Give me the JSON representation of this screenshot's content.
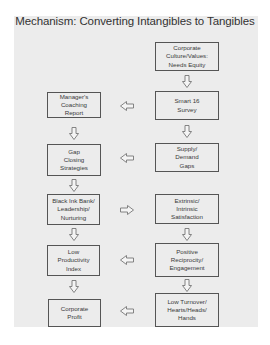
{
  "title": "Mechanism: Converting Intangibles to Tangibles",
  "colors": {
    "background": "#ececec",
    "box_border": "#555555",
    "text": "#3a3a3a",
    "arrow_stroke": "#777777"
  },
  "right_column": [
    {
      "id": "r1",
      "label": "Corporate\nCulture/Values:\nNeeds Equity"
    },
    {
      "id": "r2",
      "label": "Smart 16\nSurvey"
    },
    {
      "id": "r3",
      "label": "Supply/\nDemand\nGaps"
    },
    {
      "id": "r4",
      "label": "Extrinsic/\nIntrinsic\nSatisfaction"
    },
    {
      "id": "r5",
      "label": "Positive\nReciprocity/\nEngagement"
    },
    {
      "id": "r6",
      "label": "Low Turnover/\nHearts/Heads/\nHands"
    }
  ],
  "left_column": [
    {
      "id": "l1",
      "label": "Manager's\nCoaching\nReport"
    },
    {
      "id": "l2",
      "label": "Gap\nClosing\nStrategies"
    },
    {
      "id": "l3",
      "label": "Black Ink Bank/\nLeadership/\nNurturing"
    },
    {
      "id": "l4",
      "label": "Low\nProductivity\nIndex"
    },
    {
      "id": "l5",
      "label": "Corporate\nProfit"
    }
  ],
  "connections": [
    {
      "from": "r1",
      "to": "r2",
      "direction": "down"
    },
    {
      "from": "r2",
      "to": "r3",
      "direction": "down"
    },
    {
      "from": "r4",
      "to": "r5",
      "direction": "down"
    },
    {
      "from": "r5",
      "to": "r6",
      "direction": "down"
    },
    {
      "from": "r2",
      "to": "l1",
      "direction": "left"
    },
    {
      "from": "r3",
      "to": "l2",
      "direction": "left"
    },
    {
      "from": "l3",
      "to": "r4",
      "direction": "right"
    },
    {
      "from": "r5",
      "to": "l4",
      "direction": "left"
    },
    {
      "from": "r6",
      "to": "l5",
      "direction": "left"
    },
    {
      "from": "l1",
      "to": "l2",
      "direction": "down"
    },
    {
      "from": "l2",
      "to": "l3",
      "direction": "down"
    },
    {
      "from": "l3",
      "to": "l4",
      "direction": "down"
    },
    {
      "from": "l4",
      "to": "l5",
      "direction": "down"
    }
  ]
}
